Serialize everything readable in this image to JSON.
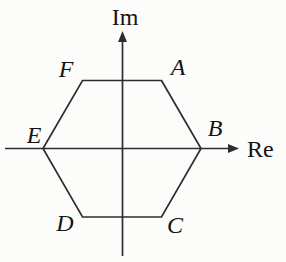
{
  "figure": {
    "colors": {
      "background": "#fcfcfb",
      "line": "#2d2d2d",
      "text": "#141414"
    },
    "axes": {
      "vertical_label": "Im",
      "horizontal_label": "Re",
      "vertical": {
        "x": 122.5,
        "y_tip": 31,
        "y_bottom": 256
      },
      "horizontal": {
        "y": 148.5,
        "x_left": 5,
        "x_tip": 239
      },
      "vertical_label_pos": {
        "x": 125,
        "y": 25
      },
      "horizontal_label_pos": {
        "x": 247,
        "y": 157
      }
    },
    "hexagon": {
      "center": {
        "x": 122,
        "y": 148.5
      },
      "circumradius": 79,
      "vertices": [
        {
          "label": "A",
          "x": 161.5,
          "y": 80.5,
          "label_x": 178,
          "label_y": 75
        },
        {
          "label": "B",
          "x": 201,
          "y": 148.5,
          "label_x": 215,
          "label_y": 136
        },
        {
          "label": "C",
          "x": 161.5,
          "y": 217,
          "label_x": 175,
          "label_y": 233
        },
        {
          "label": "D",
          "x": 82.5,
          "y": 217,
          "label_x": 65,
          "label_y": 231
        },
        {
          "label": "E",
          "x": 43,
          "y": 148.5,
          "label_x": 34,
          "label_y": 143
        },
        {
          "label": "F",
          "x": 82.5,
          "y": 80.5,
          "label_x": 66,
          "label_y": 77
        }
      ]
    }
  }
}
